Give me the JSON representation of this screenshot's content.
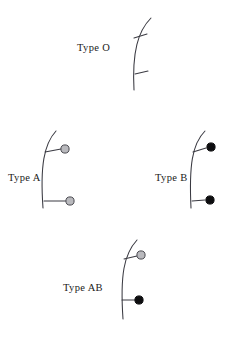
{
  "figure": {
    "background_color": "#ffffff",
    "width": 231,
    "height": 340,
    "stroke_color": "#3a3a42",
    "antigen_a_color": "#b9b9bd",
    "antigen_b_color": "#0d0d0f"
  },
  "panels": [
    {
      "id": "type-o",
      "label": "Type O",
      "label_x": 77,
      "label_y": 51,
      "membrane_path": "M 151 18 C 138 31 132 52 134 90",
      "antigens": [
        {
          "kind": "none",
          "stem": "M 134 38 L 147 34",
          "head_x": 0,
          "head_y": 0,
          "head_r": 0
        },
        {
          "kind": "none",
          "stem": "M 135 74 L 148 71",
          "head_x": 0,
          "head_y": 0,
          "head_r": 0
        }
      ]
    },
    {
      "id": "type-a",
      "label": "Type A",
      "label_x": 8,
      "label_y": 181,
      "membrane_path": "M 56 131 C 44 144 40 166 43 208",
      "antigens": [
        {
          "kind": "a",
          "stem": "M 45 152 L 61 149",
          "head_x": 65,
          "head_y": 149,
          "head_r": 4.1
        },
        {
          "kind": "a",
          "stem": "M 44 201 L 66 201",
          "head_x": 70,
          "head_y": 201,
          "head_r": 4.1
        }
      ]
    },
    {
      "id": "type-b",
      "label": "Type B",
      "label_x": 155,
      "label_y": 181,
      "membrane_path": "M 205 131 C 192 144 189 166 191 208",
      "antigens": [
        {
          "kind": "b",
          "stem": "M 193 152 L 206 148",
          "head_x": 211,
          "head_y": 147,
          "head_r": 4.1
        },
        {
          "kind": "b",
          "stem": "M 192 201 L 205 200",
          "head_x": 210,
          "head_y": 200,
          "head_r": 4.1
        }
      ]
    },
    {
      "id": "type-ab",
      "label": "Type AB",
      "label_x": 63,
      "label_y": 291,
      "membrane_path": "M 137 240 C 124 254 120 275 123 319",
      "antigens": [
        {
          "kind": "a",
          "stem": "M 124 259 L 137 256",
          "head_x": 141,
          "head_y": 255,
          "head_r": 4.1
        },
        {
          "kind": "b",
          "stem": "M 122 300 L 135 300",
          "head_x": 139,
          "head_y": 300,
          "head_r": 4.1
        }
      ]
    }
  ],
  "legend_semantics": {
    "type_o_note": "no antigen heads — bare stems only",
    "type_a_note": "gray antigen heads",
    "type_b_note": "black antigen heads",
    "type_ab_note": "one gray and one black antigen head"
  }
}
